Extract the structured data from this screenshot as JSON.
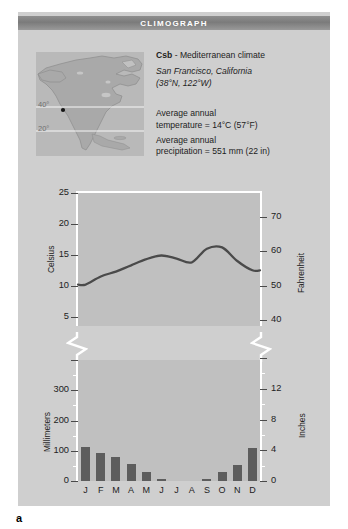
{
  "figure": {
    "letter": "a",
    "title": "CLIMOGRAPH",
    "accent_bar_color": "#7f7f7f",
    "card_color": "#cfcfcf",
    "plot_color": "#c0c0c0",
    "bar_color": "#5d5d5d",
    "line_color": "#4a4a4a"
  },
  "map": {
    "name": "north-america-locator-map",
    "latitude_labels": [
      "40°",
      "20°"
    ],
    "marker": "san-francisco-marker"
  },
  "info": {
    "code": "Csb",
    "code_suffix": " - Mediterranean climate",
    "location": "San Francisco, California",
    "coords": "(38°N, 122°W)",
    "avg_temp_line1": "Average annual",
    "avg_temp_line2": "temperature = 14°C (57°F)",
    "avg_precip_line1": "Average annual",
    "avg_precip_line2": "precipitation = 551 mm (22 in)"
  },
  "chart_data": [
    {
      "type": "line",
      "title": "Mean monthly temperature",
      "xlabel": "",
      "ylabel": "Celsius",
      "y2label": "Fahrenheit",
      "categories": [
        "J",
        "F",
        "M",
        "A",
        "M",
        "J",
        "J",
        "A",
        "S",
        "O",
        "N",
        "D"
      ],
      "values": [
        10.2,
        11.5,
        12.3,
        13.3,
        14.3,
        14.9,
        14.4,
        13.8,
        16.0,
        16.2,
        14.0,
        12.5
      ],
      "yticks": [
        5,
        10,
        15,
        20,
        25
      ],
      "ylim": [
        3.5,
        25
      ],
      "y2ticks": [
        40,
        50,
        60,
        70
      ],
      "y2lim": [
        38.3,
        77
      ],
      "grid": false,
      "axis_break": true,
      "units": "°C"
    },
    {
      "type": "bar",
      "title": "Mean monthly precipitation",
      "xlabel": "",
      "ylabel": "Millimeters",
      "y2label": "Inches",
      "categories": [
        "J",
        "F",
        "M",
        "A",
        "M",
        "J",
        "J",
        "A",
        "S",
        "O",
        "N",
        "D"
      ],
      "values": [
        112,
        93,
        78,
        55,
        30,
        8,
        0,
        0,
        7,
        31,
        53,
        110
      ],
      "yticks": [
        0,
        100,
        200,
        300
      ],
      "ylim": [
        0,
        400
      ],
      "y2ticks": [
        0,
        4,
        8,
        12
      ],
      "y2lim": [
        0,
        16
      ],
      "grid": false,
      "axis_break": true,
      "units": "mm"
    }
  ]
}
